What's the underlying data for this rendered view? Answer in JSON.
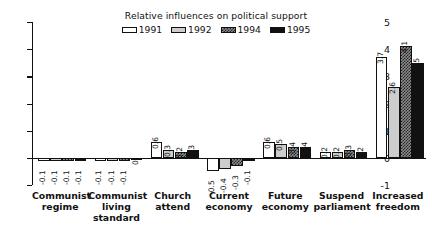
{
  "chart_data": {
    "type": "bar",
    "title": "Relative influences on political support",
    "xlabel": "",
    "ylabel": "",
    "ylim": [
      -1,
      5
    ],
    "yticks": [
      -1,
      0,
      1,
      2,
      3,
      4,
      5
    ],
    "ytick_labels": [
      "-1",
      "0",
      "1",
      "2",
      "3",
      "4",
      "5"
    ],
    "grid": false,
    "legend_position": "top-center",
    "categories": [
      "Communist regime",
      "Communist living standard",
      "Church attend",
      "Current economy",
      "Future economy",
      "Suspend parliament",
      "Increased freedom"
    ],
    "category_lines": [
      [
        "Communist",
        "regime"
      ],
      [
        "Communist",
        "living",
        "standard"
      ],
      [
        "Church",
        "attend"
      ],
      [
        "Current",
        "economy"
      ],
      [
        "Future",
        "economy"
      ],
      [
        "Suspend",
        "parliament"
      ],
      [
        "Increased",
        "freedom"
      ]
    ],
    "series": [
      {
        "name": "1991",
        "color": "#ffffff",
        "pattern": "solid-white",
        "values": [
          -0.1,
          -0.1,
          0.6,
          -0.5,
          0.6,
          0.2,
          3.7
        ],
        "labels": [
          "-0.1",
          "-0.1",
          "0.6",
          "-0.5",
          "0.6",
          "0.2",
          "3.7"
        ]
      },
      {
        "name": "1992",
        "color": "#cdcdcd",
        "pattern": "solid-light-gray",
        "values": [
          -0.1,
          -0.1,
          0.3,
          -0.4,
          0.5,
          0.2,
          2.6
        ],
        "labels": [
          "-0.1",
          "-0.1",
          "0.3",
          "-0.4",
          "0.5",
          "0.2",
          "2.6"
        ]
      },
      {
        "name": "1994",
        "color": "#8d8d8d",
        "pattern": "checkered",
        "values": [
          -0.1,
          -0.1,
          0.2,
          -0.3,
          0.4,
          0.3,
          4.1
        ],
        "labels": [
          "-0.1",
          "-0.1",
          "0.2",
          "-0.3",
          "0.4",
          "0.3",
          "4.1"
        ]
      },
      {
        "name": "1995",
        "color": "#111111",
        "pattern": "solid-black",
        "values": [
          -0.1,
          0,
          0.3,
          -0.1,
          0.4,
          0.2,
          3.5
        ],
        "labels": [
          "-0.1",
          "0",
          "0.3",
          "-0.1",
          "0.4",
          "0.2",
          "3.5"
        ]
      }
    ]
  }
}
